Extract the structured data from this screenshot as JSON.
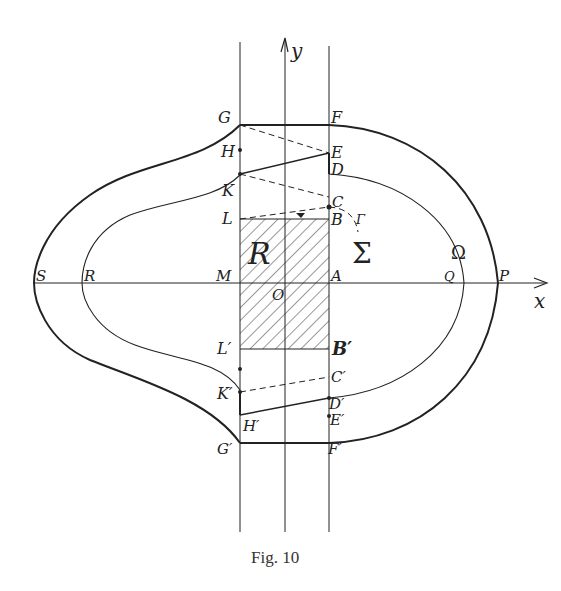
{
  "figure": {
    "caption": "Fig. 10",
    "axes": {
      "x_label": "x",
      "y_label": "y"
    },
    "regions": {
      "rectangle": "R",
      "inner_region": "Σ",
      "outer_region": "Ω",
      "curve": "Γ"
    },
    "points_upper": {
      "G": "G",
      "F": "F",
      "H": "H",
      "E": "E",
      "D": "D",
      "K": "K",
      "C": "C",
      "L": "L",
      "B": "B"
    },
    "points_axis": {
      "S": "S",
      "R": "R",
      "M": "M",
      "O": "O",
      "A": "A",
      "Q": "Q",
      "P": "P"
    },
    "points_lower": {
      "L": "L′",
      "B": "B′",
      "C": "C′",
      "K": "K′",
      "D": "D′",
      "H": "H′",
      "E": "E′",
      "G": "G′",
      "F": "F′"
    },
    "colors": {
      "ink": "#222222",
      "background": "#ffffff"
    }
  }
}
